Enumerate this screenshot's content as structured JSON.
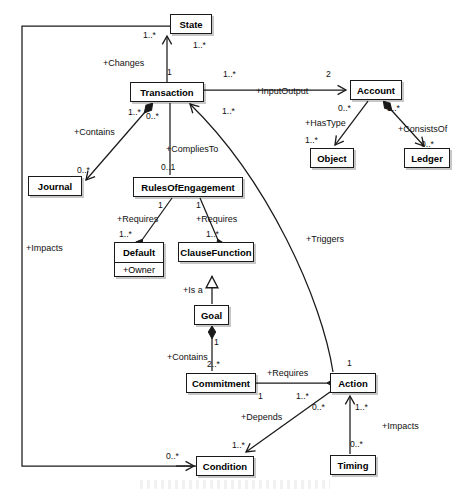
{
  "diagram": {
    "type": "uml-class-diagram",
    "title": "",
    "classes": [
      {
        "id": "state",
        "name": "State",
        "x": 170,
        "y": 14,
        "w": 42,
        "h": 20,
        "attributes": []
      },
      {
        "id": "transaction",
        "name": "Transaction",
        "x": 130,
        "y": 82,
        "w": 74,
        "h": 20,
        "attributes": []
      },
      {
        "id": "account",
        "name": "Account",
        "x": 350,
        "y": 80,
        "w": 52,
        "h": 20,
        "attributes": []
      },
      {
        "id": "object",
        "name": "Object",
        "x": 310,
        "y": 148,
        "w": 44,
        "h": 20,
        "attributes": []
      },
      {
        "id": "ledger",
        "name": "Ledger",
        "x": 404,
        "y": 148,
        "w": 46,
        "h": 20,
        "attributes": []
      },
      {
        "id": "journal",
        "name": "Journal",
        "x": 28,
        "y": 176,
        "w": 54,
        "h": 20,
        "attributes": []
      },
      {
        "id": "rulesofengagement",
        "name": "RulesOfEngagement",
        "x": 133,
        "y": 177,
        "w": 110,
        "h": 20,
        "attributes": []
      },
      {
        "id": "default",
        "name": "Default",
        "x": 114,
        "y": 242,
        "w": 50,
        "h": 35,
        "attributes": [
          "+Owner"
        ]
      },
      {
        "id": "clausefunction",
        "name": "ClauseFunction",
        "x": 178,
        "y": 242,
        "w": 76,
        "h": 20,
        "attributes": []
      },
      {
        "id": "goal",
        "name": "Goal",
        "x": 194,
        "y": 305,
        "w": 35,
        "h": 20,
        "attributes": []
      },
      {
        "id": "commitment",
        "name": "Commitment",
        "x": 186,
        "y": 373,
        "w": 70,
        "h": 20,
        "attributes": []
      },
      {
        "id": "action",
        "name": "Action",
        "x": 330,
        "y": 373,
        "w": 46,
        "h": 20,
        "attributes": []
      },
      {
        "id": "condition",
        "name": "Condition",
        "x": 196,
        "y": 456,
        "w": 58,
        "h": 20,
        "attributes": []
      },
      {
        "id": "timing",
        "name": "Timing",
        "x": 330,
        "y": 455,
        "w": 46,
        "h": 20,
        "attributes": []
      }
    ],
    "relationships": [
      {
        "id": "changes",
        "label": "+Changes",
        "from": "transaction",
        "to": "state",
        "source_mult": "1",
        "target_mult": "1..*"
      },
      {
        "id": "impacts-state",
        "label": "+Impacts",
        "from": "condition",
        "to": "state",
        "source_mult": "0..*",
        "target_mult": "1..*"
      },
      {
        "id": "inputoutput",
        "label": "+InputOutput",
        "from": "transaction",
        "to": "account",
        "source_mult": "1..*",
        "target_mult": "2"
      },
      {
        "id": "contains-journal",
        "label": "+Contains",
        "from": "transaction",
        "to": "journal",
        "source_mult": "1..*",
        "target_mult": "0..*"
      },
      {
        "id": "compliesto",
        "label": "+CompliesTo",
        "from": "transaction",
        "to": "rulesofengagement",
        "source_mult": "0..*",
        "target_mult": "0..1"
      },
      {
        "id": "triggers",
        "label": "+Triggers",
        "from": "transaction",
        "to": "action",
        "source_mult": "1..*",
        "target_mult": "1"
      },
      {
        "id": "hastype",
        "label": "+HasType",
        "from": "account",
        "to": "object",
        "source_mult": "0..*",
        "target_mult": "1..*"
      },
      {
        "id": "consistsof",
        "label": "+ConsistsOf",
        "from": "account",
        "to": "ledger",
        "source_mult": "1..*",
        "target_mult": "0..*"
      },
      {
        "id": "requires-default",
        "label": "+Requires",
        "from": "rulesofengagement",
        "to": "default",
        "source_mult": "1",
        "target_mult": "1..*"
      },
      {
        "id": "requires-clause",
        "label": "+Requires",
        "from": "rulesofengagement",
        "to": "clausefunction",
        "source_mult": "1",
        "target_mult": "1..*"
      },
      {
        "id": "isa",
        "label": "+Is a",
        "from": "goal",
        "to": "clausefunction",
        "source_mult": "",
        "target_mult": ""
      },
      {
        "id": "contains-commitment",
        "label": "+Contains",
        "from": "goal",
        "to": "commitment",
        "source_mult": "1",
        "target_mult": "2..*"
      },
      {
        "id": "requires-action",
        "label": "+Requires",
        "from": "commitment",
        "to": "action",
        "source_mult": "1",
        "target_mult": "1..*"
      },
      {
        "id": "depends",
        "label": "+Depends",
        "from": "condition",
        "to": "action",
        "source_mult": "1..*",
        "target_mult": "0..*"
      },
      {
        "id": "impacts-action",
        "label": "+Impacts",
        "from": "timing",
        "to": "action",
        "source_mult": "0..*",
        "target_mult": "1..*"
      }
    ],
    "edge_labels": [
      {
        "id": "lbl-changes",
        "text": "+Changes",
        "x": 103,
        "y": 58
      },
      {
        "id": "lbl-inputoutput",
        "text": "+InputOutput",
        "x": 256,
        "y": 86
      },
      {
        "id": "lbl-contains-j",
        "text": "+Contains",
        "x": 74,
        "y": 127
      },
      {
        "id": "lbl-compliesto",
        "text": "+CompliesTo",
        "x": 166,
        "y": 144
      },
      {
        "id": "lbl-hastype",
        "text": "+HasType",
        "x": 305,
        "y": 118
      },
      {
        "id": "lbl-consistsof",
        "text": "+ConsistsOf",
        "x": 398,
        "y": 124
      },
      {
        "id": "lbl-impacts-left",
        "text": "+Impacts",
        "x": 26,
        "y": 243
      },
      {
        "id": "lbl-requires-1",
        "text": "+Requires",
        "x": 117,
        "y": 214
      },
      {
        "id": "lbl-requires-2",
        "text": "+Requires",
        "x": 196,
        "y": 214
      },
      {
        "id": "lbl-triggers",
        "text": "+Triggers",
        "x": 306,
        "y": 234
      },
      {
        "id": "lbl-isa",
        "text": "+Is a",
        "x": 183,
        "y": 285
      },
      {
        "id": "lbl-contains-c",
        "text": "+Contains",
        "x": 167,
        "y": 352
      },
      {
        "id": "lbl-requires-3",
        "text": "+Requires",
        "x": 267,
        "y": 368
      },
      {
        "id": "lbl-depends",
        "text": "+Depends",
        "x": 241,
        "y": 412
      },
      {
        "id": "lbl-impacts-t",
        "text": "+Impacts",
        "x": 382,
        "y": 421
      }
    ],
    "multiplicity_labels": [
      {
        "id": "m-state-left",
        "text": "1..*",
        "x": 143,
        "y": 31
      },
      {
        "id": "m-state-bottom",
        "text": "1..*",
        "x": 193,
        "y": 41
      },
      {
        "id": "m-trans-top",
        "text": "1",
        "x": 167,
        "y": 68
      },
      {
        "id": "m-trans-right",
        "text": "1..*",
        "x": 223,
        "y": 70
      },
      {
        "id": "m-account-top",
        "text": "2",
        "x": 326,
        "y": 70
      },
      {
        "id": "m-trans-bl",
        "text": "1..*",
        "x": 128,
        "y": 108
      },
      {
        "id": "m-trans-b",
        "text": "0..*",
        "x": 146,
        "y": 112
      },
      {
        "id": "m-trans-br",
        "text": "1..*",
        "x": 222,
        "y": 107
      },
      {
        "id": "m-account-bl",
        "text": "0..*",
        "x": 338,
        "y": 104
      },
      {
        "id": "m-account-br",
        "text": "1..*",
        "x": 387,
        "y": 104
      },
      {
        "id": "m-object-top",
        "text": "1..*",
        "x": 305,
        "y": 136
      },
      {
        "id": "m-ledger-top",
        "text": "0..*",
        "x": 421,
        "y": 140
      },
      {
        "id": "m-journal-top",
        "text": "0..*",
        "x": 77,
        "y": 166
      },
      {
        "id": "m-roe-top",
        "text": "0..1",
        "x": 161,
        "y": 163
      },
      {
        "id": "m-roe-bl",
        "text": "1",
        "x": 158,
        "y": 201
      },
      {
        "id": "m-roe-br",
        "text": "1",
        "x": 196,
        "y": 201
      },
      {
        "id": "m-default-top",
        "text": "1..*",
        "x": 119,
        "y": 230
      },
      {
        "id": "m-clause-top",
        "text": "1..*",
        "x": 206,
        "y": 230
      },
      {
        "id": "m-goal-bottom",
        "text": "1",
        "x": 214,
        "y": 338
      },
      {
        "id": "m-commit-top",
        "text": "2..*",
        "x": 207,
        "y": 360
      },
      {
        "id": "m-commit-right",
        "text": "1",
        "x": 258,
        "y": 392
      },
      {
        "id": "m-action-left",
        "text": "1..*",
        "x": 296,
        "y": 392
      },
      {
        "id": "m-action-topline",
        "text": "1",
        "x": 347,
        "y": 359
      },
      {
        "id": "m-action-below",
        "text": "1..*",
        "x": 355,
        "y": 403
      },
      {
        "id": "m-depends-src",
        "text": "0..*",
        "x": 312,
        "y": 403
      },
      {
        "id": "m-condition-top",
        "text": "1..*",
        "x": 232,
        "y": 441
      },
      {
        "id": "m-condition-left",
        "text": "0..*",
        "x": 166,
        "y": 452
      },
      {
        "id": "m-timing-top",
        "text": "0..*",
        "x": 350,
        "y": 440
      }
    ]
  }
}
